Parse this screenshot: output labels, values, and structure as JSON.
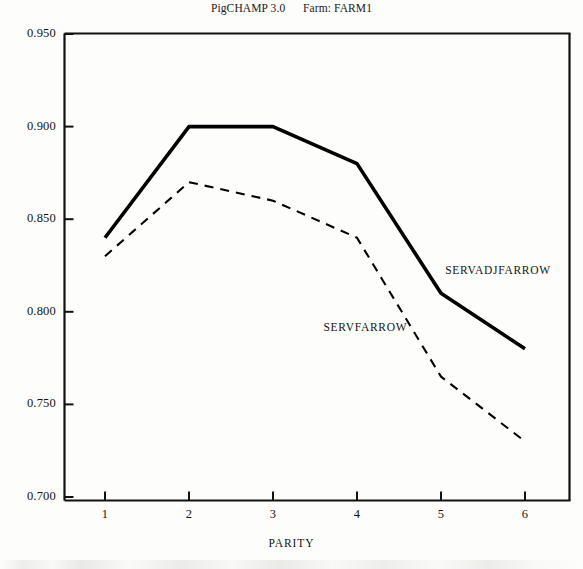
{
  "chart_data": {
    "type": "line",
    "title": "PigCHAMP 3.0      Farm: FARM1",
    "xlabel": "PARITY",
    "ylabel": "",
    "categories": [
      "1",
      "2",
      "3",
      "4",
      "5",
      "6"
    ],
    "x": [
      1,
      2,
      3,
      4,
      5,
      6
    ],
    "xlim": [
      0.5,
      6.5
    ],
    "ylim": [
      0.7,
      0.95
    ],
    "yticks": [
      "0.950",
      "0.900",
      "0.850",
      "0.800",
      "0.750",
      "0.700"
    ],
    "ytick_values": [
      0.95,
      0.9,
      0.85,
      0.8,
      0.75,
      0.7
    ],
    "grid": false,
    "legend_position": "inline-annotation",
    "series": [
      {
        "name": "SERVADJFARROW",
        "style": "solid",
        "color": "#000000",
        "values": [
          0.84,
          0.9,
          0.9,
          0.88,
          0.81,
          0.78
        ]
      },
      {
        "name": "SERVFARROW",
        "style": "dashed",
        "color": "#000000",
        "values": [
          0.83,
          0.87,
          0.86,
          0.84,
          0.765,
          0.73
        ]
      }
    ],
    "annotations": [
      {
        "text": "SERVADJFARROW",
        "x": 5.05,
        "y": 0.822
      },
      {
        "text": "SERVFARROW",
        "x": 3.6,
        "y": 0.791
      }
    ]
  }
}
